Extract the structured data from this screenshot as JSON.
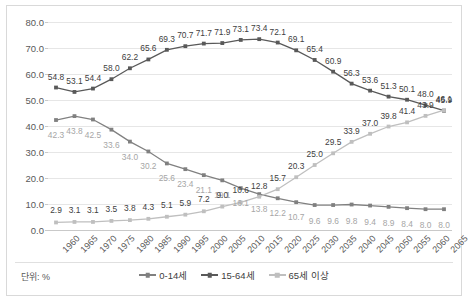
{
  "unit_note": "단위: %",
  "axes": {
    "y_ticks": [
      "0.0",
      "10.0",
      "20.0",
      "30.0",
      "40.0",
      "50.0",
      "60.0",
      "70.0",
      "80.0"
    ],
    "ymin": 0,
    "ymax": 80,
    "y_step": 10
  },
  "legend": {
    "items": [
      {
        "label": "0-14세",
        "color": "#808080"
      },
      {
        "label": "15-64세",
        "color": "#595959"
      },
      {
        "label": "65세 이상",
        "color": "#bfbfbf"
      }
    ]
  },
  "chart_data": {
    "type": "line",
    "title": "",
    "xlabel": "",
    "ylabel": "",
    "ylim": [
      0,
      80
    ],
    "grid": true,
    "legend_position": "bottom",
    "categories": [
      "1960",
      "1965",
      "1970",
      "1975",
      "1980",
      "1985",
      "1990",
      "1995",
      "2000",
      "2005",
      "2010",
      "2015",
      "2020",
      "2025",
      "2030",
      "2035",
      "2040",
      "2045",
      "2050",
      "2055",
      "2060",
      "2065"
    ],
    "series": [
      {
        "name": "0-14세",
        "color": "#808080",
        "label_class": "dl-light",
        "values": [
          42.3,
          43.8,
          42.5,
          38.6,
          34.0,
          30.2,
          25.6,
          23.4,
          21.1,
          19.1,
          16.1,
          13.8,
          12.2,
          10.7,
          9.6,
          9.6,
          9.8,
          9.4,
          8.9,
          8.4,
          8.0,
          8.0
        ],
        "labels": [
          "42.3",
          "43.8",
          "42.5",
          "33.6",
          "34.0",
          "30.2",
          "25.6",
          "23.4",
          "21.1",
          "19.1",
          "16.1",
          "13.8",
          "12.2",
          "10.7",
          "9.6",
          "9.6",
          "9.8",
          "9.4",
          "8.9",
          "8.4",
          "8.0",
          "8.0"
        ]
      },
      {
        "name": "15-64세",
        "color": "#595959",
        "label_class": "dl-dark",
        "values": [
          54.8,
          53.1,
          54.4,
          58.0,
          62.2,
          65.6,
          69.3,
          70.7,
          71.7,
          71.9,
          73.1,
          73.4,
          72.1,
          69.1,
          65.4,
          60.9,
          56.3,
          53.6,
          51.3,
          50.1,
          48.0,
          45.9
        ],
        "labels": [
          "54.8",
          "53.1",
          "54.4",
          "58.0",
          "62.2",
          "65.6",
          "69.3",
          "70.7",
          "71.7",
          "71.9",
          "73.1",
          "73.4",
          "72.1",
          "69.1",
          "65.4",
          "60.9",
          "56.3",
          "53.6",
          "51.3",
          "50.1",
          "48.0",
          "45.9"
        ]
      },
      {
        "name": "65세 이상",
        "color": "#bfbfbf",
        "label_class": "dl-dark",
        "values": [
          2.9,
          3.1,
          3.1,
          3.5,
          3.8,
          4.3,
          5.1,
          5.9,
          7.2,
          9.0,
          10.6,
          12.8,
          15.7,
          20.3,
          25.0,
          29.5,
          33.9,
          37.0,
          39.8,
          41.4,
          43.9,
          46.1
        ],
        "labels": [
          "2.9",
          "3.1",
          "3.1",
          "3.5",
          "3.8",
          "4.3",
          "5.1",
          "5.9",
          "7.2",
          "9.0",
          "10.6",
          "12.8",
          "15.7",
          "20.3",
          "25.0",
          "29.5",
          "33.9",
          "37.0",
          "39.8",
          "41.4",
          "43.9",
          "46.1"
        ]
      }
    ]
  }
}
